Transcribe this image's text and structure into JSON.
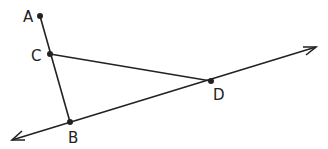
{
  "diagram": {
    "type": "geometry",
    "points": [
      {
        "id": "A",
        "label": "A"
      },
      {
        "id": "C",
        "label": "C"
      },
      {
        "id": "B",
        "label": "B"
      },
      {
        "id": "D",
        "label": "D"
      }
    ],
    "segments": [
      {
        "from": "A",
        "to": "B",
        "kind": "segment"
      },
      {
        "from": "C",
        "to": "D",
        "kind": "segment"
      }
    ],
    "lines": [
      {
        "through": [
          "B",
          "D"
        ],
        "kind": "line",
        "arrows": "both"
      }
    ],
    "colors": {
      "stroke": "#222222",
      "background": "#ffffff"
    }
  }
}
